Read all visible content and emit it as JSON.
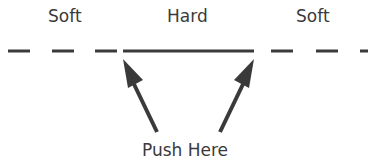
{
  "labels": {
    "left_zone": "Soft",
    "middle_zone": "Hard",
    "right_zone": "Soft",
    "action": "Push Here"
  },
  "colors": {
    "ink": "#3a3a3a",
    "background": "#ffffff"
  }
}
